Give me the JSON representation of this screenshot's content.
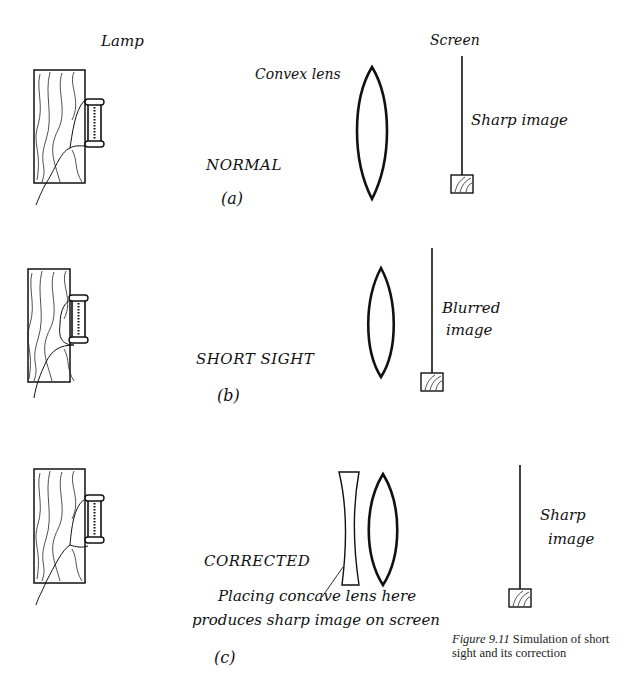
{
  "panels": [
    {
      "id": "a",
      "label": "(a)",
      "title": "NORMAL",
      "lamp_label": "Lamp",
      "lens_label": "Convex lens",
      "screen_label": "Screen",
      "image_label": "Sharp image"
    },
    {
      "id": "b",
      "label": "(b)",
      "title": "SHORT SIGHT",
      "image_label_line1": "Blurred",
      "image_label_line2": "image"
    },
    {
      "id": "c",
      "label": "(c)",
      "title": "CORRECTED",
      "note_line1": "Placing concave lens here",
      "note_line2": "produces sharp image on screen",
      "image_label_line1": "Sharp",
      "image_label_line2": "image"
    }
  ],
  "caption": {
    "figure_number": "Figure 9.11",
    "text": " Simulation of short sight and its correction"
  }
}
